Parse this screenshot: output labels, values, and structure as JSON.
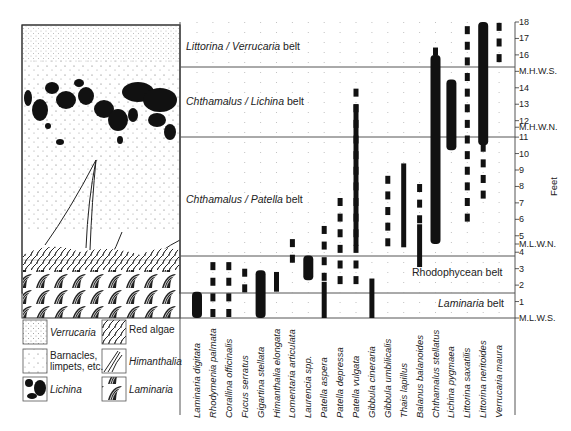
{
  "figure": {
    "y_axis": {
      "label": "Feet",
      "ticks": [
        "1",
        "2",
        "3",
        "4",
        "5",
        "6",
        "7",
        "8",
        "9",
        "10",
        "11",
        "12",
        "13",
        "14",
        "16",
        "17",
        "18"
      ],
      "tide_marks": [
        {
          "label": "M.L.W.S.",
          "feet": 0
        },
        {
          "label": "M.L.W.N.",
          "feet": 4.5
        },
        {
          "label": "M.H.W.N.",
          "feet": 11.6
        },
        {
          "label": "M.H.W.S.",
          "feet": 15
        }
      ]
    },
    "belts": [
      {
        "italic": "Littorina / Verrucaria",
        "suffix": " belt",
        "label_feet": 17
      },
      {
        "italic": "Chthamalus / Lichina",
        "suffix": " belt",
        "label_feet": 13.2
      },
      {
        "italic": "Chthamalus / Patella",
        "suffix": " belt",
        "label_feet": 8.3
      },
      {
        "italic": "",
        "plain": "Rhodophycean belt",
        "label_feet": 2.4
      },
      {
        "italic": "Laminaria",
        "suffix": " belt",
        "label_feet": 0.6
      }
    ],
    "species": [
      "Laminaria  digitata",
      "Rhodymenia  palmata",
      "Corallina  officinalis",
      "Fucus  serratus",
      "Gigartina  stellata",
      "Himanthalia  elongata",
      "Lomentaria  articulata",
      "Laurencia  spp.",
      "Patella  aspera",
      "Patella  depressa",
      "Patella  vulgata",
      "Gibbula  cineraria",
      "Gibbula  umbilicalis",
      "Thais  lapillus",
      "Balanus  balanoides",
      "Chthamalus  stellatus",
      "Lichina  pygmaea",
      "Littorina  saxatilis",
      "Littorina  neritoides",
      "Verrucaria  maura"
    ],
    "legend": [
      {
        "label": "Verrucaria",
        "italic": true
      },
      {
        "label": "Red algae",
        "italic": false
      },
      {
        "label": "Barnacles,\nlimpets, etc.",
        "line1": "Barnacles,",
        "line2": "limpets, etc.",
        "italic": false
      },
      {
        "label": "Himanthalia",
        "italic": true
      },
      {
        "label": "Lichina",
        "italic": true
      },
      {
        "label": "Laminaria",
        "italic": true
      }
    ]
  },
  "chart_data": {
    "type": "range-bar",
    "ylabel": "Feet",
    "ylim": [
      0,
      18
    ],
    "tide_levels": {
      "M.L.W.S.": 0,
      "M.L.W.N.": 4.5,
      "M.H.W.N.": 11.6,
      "M.H.W.S.": 15
    },
    "belt_boundaries_feet": [
      1.5,
      3.8,
      11,
      15.2,
      18
    ],
    "categories": [
      "Laminaria digitata",
      "Rhodymenia palmata",
      "Corallina officinalis",
      "Fucus serratus",
      "Gigartina stellata",
      "Himanthalia elongata",
      "Lomentaria articulata",
      "Laurencia spp.",
      "Patella aspera",
      "Patella depressa",
      "Patella vulgata",
      "Gibbula cineraria",
      "Gibbula umbilicalis",
      "Thais lapillus",
      "Balanus balanoides",
      "Chthamalus stellatus",
      "Lichina pygmaea",
      "Littorina saxatilis",
      "Littorina neritoides",
      "Verrucaria maura"
    ],
    "ranges": [
      {
        "solid": [
          0,
          1.6
        ],
        "dashed": null
      },
      {
        "solid": null,
        "dashed": [
          0,
          3.3
        ]
      },
      {
        "solid": null,
        "dashed": [
          0,
          3.6
        ]
      },
      {
        "solid": null,
        "dashed": [
          1.5,
          3.3
        ]
      },
      {
        "solid": [
          0,
          2.9
        ],
        "dashed": null
      },
      {
        "solid": [
          1.6,
          2.8
        ],
        "dashed": null
      },
      {
        "solid": null,
        "dashed": [
          3.3,
          4.5
        ]
      },
      {
        "solid": [
          2.3,
          3.8
        ],
        "dashed": null
      },
      {
        "solid": [
          0,
          2.2
        ],
        "dashed": [
          2.2,
          5.5
        ]
      },
      {
        "solid": null,
        "dashed": [
          2,
          7.1
        ]
      },
      {
        "solid": [
          4.4,
          13
        ],
        "dashed": [
          2,
          13.4
        ]
      },
      {
        "solid": [
          0,
          2.4
        ],
        "dashed": null
      },
      {
        "solid": null,
        "dashed": [
          4.3,
          8.1
        ]
      },
      {
        "solid": [
          4.3,
          9.4
        ],
        "dashed": null
      },
      {
        "solid": [
          3.1,
          5.7
        ],
        "dashed": [
          5.7,
          7.8
        ]
      },
      {
        "solid": [
          4.5,
          16
        ],
        "dashed": [
          4.5,
          16.5
        ]
      },
      {
        "solid": [
          10.2,
          14.5
        ],
        "dashed": null
      },
      {
        "solid": null,
        "dashed": [
          5.8,
          17.5
        ]
      },
      {
        "solid": [
          10.5,
          18
        ],
        "dashed": [
          7.2,
          10.3
        ]
      },
      {
        "solid": null,
        "dashed": [
          15.5,
          18
        ]
      }
    ]
  }
}
